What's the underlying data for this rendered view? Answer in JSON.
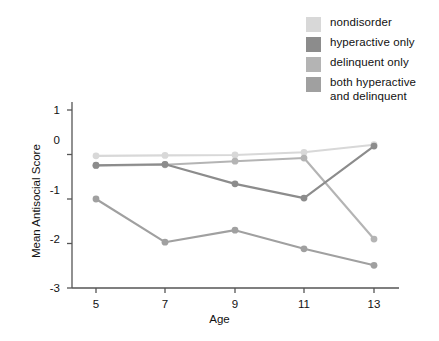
{
  "chart_data": {
    "type": "line",
    "title": "",
    "xlabel": "Age",
    "ylabel": "Mean Antisocial Score",
    "x": [
      5,
      7,
      9,
      11,
      13
    ],
    "xticklabels": [
      "5",
      "7",
      "9",
      "11",
      "13"
    ],
    "yticklabels": [
      "1",
      "0",
      "-1",
      "-2",
      "-3"
    ],
    "ylim": [
      -3,
      1
    ],
    "xlim": [
      4,
      14
    ],
    "grid": false,
    "legend_position": "top-right",
    "series": [
      {
        "name": "nondisorder",
        "color": "#d8d8d8",
        "values": [
          -0.03,
          -0.02,
          -0.01,
          0.05,
          0.22
        ]
      },
      {
        "name": "hyperactive only",
        "color": "#8c8c8c",
        "values": [
          -0.24,
          -0.22,
          -0.66,
          -0.98,
          0.19
        ]
      },
      {
        "name": "delinquent only",
        "color": "#b4b4b4",
        "values": [
          -0.25,
          -0.23,
          -0.15,
          -0.08,
          -1.9
        ]
      },
      {
        "name": "both hyperactive and delinquent",
        "color": "#a0a0a0",
        "values": [
          -1.0,
          -1.97,
          -1.7,
          -2.12,
          -2.49
        ]
      }
    ]
  },
  "legend": {
    "items": [
      {
        "label": "nondisorder",
        "color": "#d8d8d8"
      },
      {
        "label": "hyperactive only",
        "color": "#8c8c8c"
      },
      {
        "label": "delinquent only",
        "color": "#b4b4b4"
      },
      {
        "label": "both hyperactive\nand delinquent",
        "color": "#a0a0a0"
      }
    ]
  },
  "axes": {
    "y_title": "Mean Antisocial Score",
    "x_title": "Age",
    "y_ticks": [
      "1",
      "0",
      "-1",
      "-2",
      "-3"
    ],
    "x_ticks": [
      "5",
      "7",
      "9",
      "11",
      "13"
    ]
  },
  "colors": {
    "axis": "#555555",
    "text": "#111111",
    "background": "#ffffff"
  }
}
